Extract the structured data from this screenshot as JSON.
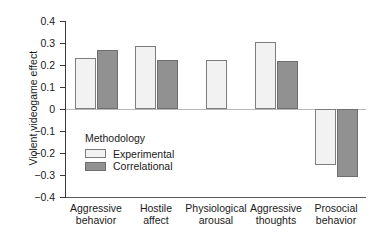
{
  "chart_data": {
    "type": "bar",
    "title": "",
    "xlabel": "",
    "ylabel": "Violent videogame effect",
    "ylim": [
      -0.4,
      0.4
    ],
    "yticks": [
      0.4,
      0.3,
      0.2,
      0.1,
      0,
      -0.1,
      -0.2,
      -0.3,
      -0.4
    ],
    "ytick_labels": [
      "0.4",
      "0.3",
      "0.2",
      "0.1",
      "0",
      "−0.1",
      "−0.2",
      "−0.3",
      "−0.4"
    ],
    "grid": false,
    "legend_position": "inside-left",
    "legend_title": "Methodology",
    "categories": [
      "Aggressive behavior",
      "Hostile affect",
      "Physiological arousal",
      "Aggressive thoughts",
      "Prosocial behavior"
    ],
    "category_lines": [
      [
        "Aggressive",
        "behavior"
      ],
      [
        "Hostile",
        "affect"
      ],
      [
        "Physiological",
        "arousal"
      ],
      [
        "Aggressive",
        "thoughts"
      ],
      [
        "Prosocial",
        "behavior"
      ]
    ],
    "series": [
      {
        "name": "Experimental",
        "color": "#f2f2f2",
        "values": [
          0.23,
          0.285,
          0.225,
          0.305,
          -0.255
        ]
      },
      {
        "name": "Correlational",
        "color": "#919191",
        "values": [
          0.27,
          0.225,
          null,
          0.22,
          -0.31
        ]
      }
    ]
  },
  "legend": {
    "title": "Methodology",
    "items": [
      {
        "label": "Experimental",
        "color": "#f2f2f2"
      },
      {
        "label": "Correlational",
        "color": "#919191"
      }
    ]
  },
  "axes": {
    "y_title": "Violent videogame effect"
  }
}
